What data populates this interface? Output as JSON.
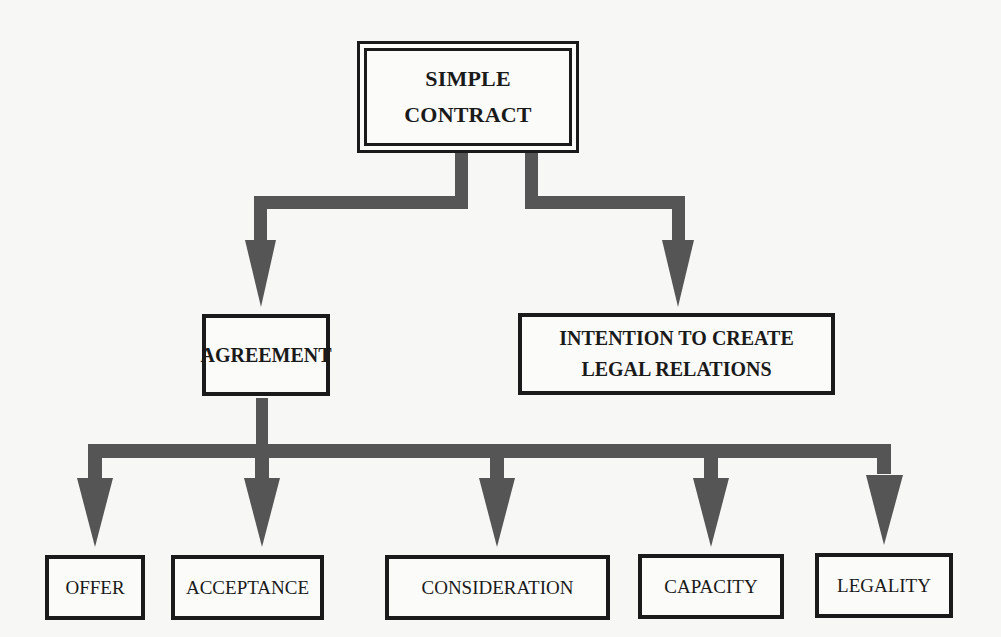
{
  "diagram": {
    "type": "hierarchy",
    "root": {
      "label_lines": [
        "SIMPLE",
        "CONTRACT"
      ]
    },
    "level2": [
      {
        "id": "agreement",
        "label_lines": [
          "AGREEMENT"
        ]
      },
      {
        "id": "intention",
        "label_lines": [
          "INTENTION TO CREATE",
          "LEGAL RELATIONS"
        ]
      }
    ],
    "level3": [
      {
        "id": "offer",
        "label": "OFFER"
      },
      {
        "id": "acceptance",
        "label": "ACCEPTANCE"
      },
      {
        "id": "consideration",
        "label": "CONSIDERATION"
      },
      {
        "id": "capacity",
        "label": "CAPACITY"
      },
      {
        "id": "legality",
        "label": "LEGALITY"
      }
    ],
    "edges": [
      [
        "SIMPLE CONTRACT",
        "AGREEMENT"
      ],
      [
        "SIMPLE CONTRACT",
        "INTENTION TO CREATE LEGAL RELATIONS"
      ],
      [
        "AGREEMENT",
        "OFFER"
      ],
      [
        "AGREEMENT",
        "ACCEPTANCE"
      ],
      [
        "AGREEMENT",
        "CONSIDERATION"
      ],
      [
        "AGREEMENT",
        "CAPACITY"
      ],
      [
        "AGREEMENT",
        "LEGALITY"
      ]
    ],
    "colors": {
      "arrow": "#555555",
      "border": "#1a1a1a",
      "background": "#f7f7f5"
    }
  }
}
